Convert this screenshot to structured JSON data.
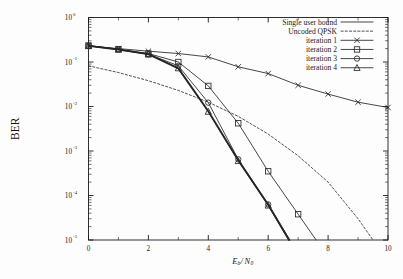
{
  "chart_data": {
    "type": "line",
    "title": "",
    "xlabel": "Eb/N0",
    "xlabel_parts": {
      "e": "E",
      "b": "b",
      "slash": "/",
      "n": "N",
      "zero": "0"
    },
    "ylabel": "BER",
    "xlim": [
      0,
      10
    ],
    "ylim": [
      1e-05,
      1
    ],
    "yscale": "log",
    "grid": false,
    "legend_position": "top-right",
    "xticks": [
      0,
      2,
      4,
      6,
      8,
      10
    ],
    "xtick_labels": [
      "0",
      "2",
      "4",
      "6",
      "8",
      "10"
    ],
    "xminor": [
      1,
      3,
      5,
      7,
      9
    ],
    "ytick_labels": [
      "10^0",
      "10^-1",
      "10^-2",
      "10^-3",
      "10^-4",
      "10^-5"
    ],
    "ytick_mantissa": "10",
    "ytick_exponents": [
      "0",
      "-1",
      "-2",
      "-3",
      "-4",
      "-5"
    ],
    "series": [
      {
        "name": "Single user bound",
        "marker": "none",
        "style": "solid-thick",
        "x": [
          0,
          1,
          2,
          3,
          4,
          5,
          6,
          6.7
        ],
        "values": [
          0.23,
          0.19,
          0.15,
          0.072,
          0.0078,
          0.00062,
          6.2e-05,
          1e-05
        ]
      },
      {
        "name": "Uncoded QPSK",
        "marker": "none",
        "style": "dashed",
        "x": [
          0,
          1,
          2,
          3,
          4,
          5,
          6,
          7,
          8,
          9,
          9.5
        ],
        "values": [
          0.082,
          0.058,
          0.038,
          0.023,
          0.0125,
          0.006,
          0.0024,
          0.00078,
          0.0002,
          3e-05,
          1e-05
        ]
      },
      {
        "name": "iteration 1",
        "marker": "x",
        "style": "solid",
        "x": [
          0,
          1,
          2,
          3,
          4,
          5,
          6,
          7,
          8,
          9,
          10
        ],
        "values": [
          0.23,
          0.2,
          0.175,
          0.155,
          0.13,
          0.078,
          0.055,
          0.03,
          0.019,
          0.0125,
          0.0095
        ]
      },
      {
        "name": "iteration 2",
        "marker": "square",
        "style": "solid",
        "x": [
          0,
          1,
          2,
          3,
          4,
          5,
          6,
          7,
          7.6
        ],
        "values": [
          0.235,
          0.195,
          0.155,
          0.1,
          0.029,
          0.0042,
          0.00035,
          3.8e-05,
          1e-05
        ]
      },
      {
        "name": "iteration 3",
        "marker": "circle",
        "style": "solid",
        "x": [
          0,
          1,
          2,
          3,
          4,
          5,
          6,
          6.72
        ],
        "values": [
          0.232,
          0.192,
          0.15,
          0.082,
          0.0122,
          0.00065,
          6.3e-05,
          1e-05
        ]
      },
      {
        "name": "iteration 4",
        "marker": "triangle",
        "style": "solid",
        "x": [
          0,
          1,
          2,
          3,
          4,
          5,
          6,
          6.68
        ],
        "values": [
          0.23,
          0.19,
          0.148,
          0.073,
          0.0077,
          0.0006,
          6e-05,
          1e-05
        ]
      }
    ]
  },
  "legend": {
    "entries": [
      {
        "label": "Single user bound",
        "sample": "solid-thin"
      },
      {
        "label": "Uncoded QPSK",
        "sample": "dashed"
      },
      {
        "label": "iteration 1",
        "sample": "x"
      },
      {
        "label": "iteration 2",
        "sample": "square"
      },
      {
        "label": "iteration 3",
        "sample": "circle"
      },
      {
        "label": "iteration 4",
        "sample": "triangle"
      }
    ]
  },
  "colors": {
    "ink": "#262626",
    "axis": "#1a1a1a",
    "background": "#fdfdfd"
  }
}
